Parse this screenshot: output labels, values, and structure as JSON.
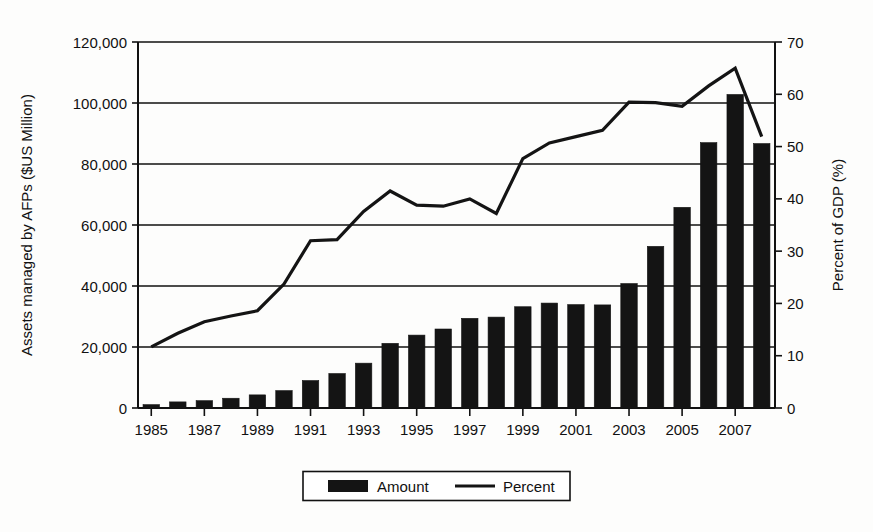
{
  "chart_data": {
    "type": "bar",
    "title": "",
    "subtitle": "",
    "xlabel": "",
    "ylabel": "Assets managed by AFPs ($US Million)",
    "y2label": "Percent of GDP (%)",
    "ylim": [
      0,
      120000
    ],
    "y2lim": [
      0,
      70
    ],
    "grid": true,
    "legend_position": "bottom",
    "x": [
      1985,
      1986,
      1987,
      1988,
      1989,
      1990,
      1991,
      1992,
      1993,
      1994,
      1995,
      1996,
      1997,
      1998,
      1999,
      2000,
      2001,
      2002,
      2003,
      2004,
      2005,
      2006,
      2007,
      2008
    ],
    "categories": [
      "1985",
      "1986",
      "1987",
      "1988",
      "1989",
      "1990",
      "1991",
      "1992",
      "1993",
      "1994",
      "1995",
      "1996",
      "1997",
      "1998",
      "1999",
      "2000",
      "2001",
      "2002",
      "2003",
      "2004",
      "2005",
      "2006",
      "2007",
      "2008"
    ],
    "xtick_labels": [
      "1985",
      "1987",
      "1989",
      "1991",
      "1993",
      "1995",
      "1997",
      "1999",
      "2001",
      "2003",
      "2005",
      "2007"
    ],
    "xtick_values": [
      1985,
      1987,
      1989,
      1991,
      1993,
      1995,
      1997,
      1999,
      2001,
      2003,
      2005,
      2007
    ],
    "ytick_labels": [
      "0",
      "20,000",
      "40,000",
      "60,000",
      "80,000",
      "100,000",
      "120,000"
    ],
    "ytick_values": [
      0,
      20000,
      40000,
      60000,
      80000,
      100000,
      120000
    ],
    "y2tick_labels": [
      "0",
      "10",
      "20",
      "30",
      "40",
      "50",
      "60",
      "70"
    ],
    "y2tick_values": [
      0,
      10,
      20,
      30,
      40,
      50,
      60,
      70
    ],
    "series": [
      {
        "name": "Amount",
        "type": "bar",
        "axis": "left",
        "color": "#141414",
        "values": [
          1100,
          2000,
          2400,
          3200,
          4300,
          5700,
          9000,
          11300,
          14700,
          21200,
          23900,
          25900,
          29400,
          29800,
          33200,
          34400,
          33900,
          33800,
          40800,
          53000,
          65800,
          87000,
          102800,
          86700
        ]
      },
      {
        "name": "Percent",
        "type": "line",
        "axis": "right",
        "color": "#141414",
        "values": [
          11.7,
          14.3,
          16.5,
          17.6,
          18.6,
          23.7,
          32.0,
          32.2,
          37.6,
          41.5,
          38.8,
          38.6,
          40.0,
          37.2,
          47.7,
          50.7,
          51.9,
          53.1,
          58.5,
          58.4,
          57.7,
          61.6,
          65.0,
          51.9
        ]
      }
    ],
    "legend": [
      {
        "label": "Amount",
        "marker": "filled-rect",
        "color": "#141414"
      },
      {
        "label": "Percent",
        "marker": "line",
        "color": "#141414"
      }
    ]
  },
  "plot": {
    "left": 138,
    "right": 775,
    "top": 42,
    "bottom": 408
  }
}
